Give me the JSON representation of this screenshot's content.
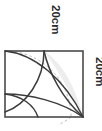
{
  "figure": {
    "name": "square-with-arcs-diagram",
    "background_color": "#ffffff",
    "square": {
      "name": "square-outline",
      "side_label": "20cm",
      "x": 5,
      "y": 51,
      "size": 78,
      "stroke_color": "#4a4a4a",
      "stroke_width": 1.6,
      "fill": "none"
    },
    "dashed_arc": {
      "name": "dashed-construction-arc",
      "stroke_color": "#b4b4b4",
      "stroke_width": 1,
      "dash_pattern": "2.5,2.5",
      "center_x": 5,
      "center_y": 117,
      "radius": 66
    },
    "arcs": [
      {
        "name": "quarter-arc-from-top-left",
        "stroke_color": "#3c3c3c",
        "stroke_width": 1.5
      },
      {
        "name": "quarter-arc-from-bottom-right",
        "stroke_color": "#3c3c3c",
        "stroke_width": 1.5
      },
      {
        "name": "semicircle-lower-left",
        "stroke_color": "#3c3c3c",
        "stroke_width": 1.5
      }
    ],
    "shaded_region": {
      "name": "shaded-lens-region",
      "fill_color": "#ebebeb",
      "stroke_color": "#3c3c3c"
    },
    "labels": [
      {
        "name": "top-side-label",
        "text": "20cm",
        "rotation": 90,
        "x": 48,
        "y": 8
      },
      {
        "name": "right-side-label",
        "text": "20cm",
        "rotation": 90,
        "x": 92,
        "y": 58
      }
    ]
  }
}
